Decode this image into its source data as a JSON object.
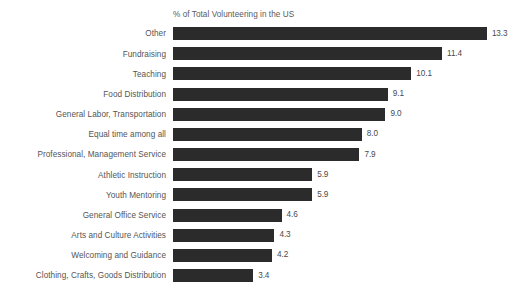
{
  "chart_data": {
    "type": "bar",
    "orientation": "horizontal",
    "title": "% of Total Volunteering in the US",
    "xlabel": "",
    "ylabel": "",
    "grid": false,
    "legend": false,
    "xlim": [
      0,
      13.3
    ],
    "value_format": "one-decimal",
    "categories": [
      "Other",
      "Fundraising",
      "Teaching",
      "Food Distribution",
      "General Labor, Transportation",
      "Equal time among all",
      "Professional, Management Service",
      "Athletic Instruction",
      "Youth Mentoring",
      "General Office Service",
      "Arts and Culture Activities",
      "Welcoming and Guidance",
      "Clothing, Crafts, Goods Distribution"
    ],
    "values": [
      13.3,
      11.4,
      10.1,
      9.1,
      9.0,
      8.0,
      7.9,
      5.9,
      5.9,
      4.6,
      4.3,
      4.2,
      3.4
    ],
    "labels": [
      "13.3",
      "11.4",
      "10.1",
      "9.1",
      "9.0",
      "8.0",
      "7.9",
      "5.9",
      "5.9",
      "4.6",
      "4.3",
      "4.2",
      "3.4"
    ],
    "bar_color": "#2b2b2b",
    "background_color": "#ffffff",
    "text_color": "#555555"
  }
}
